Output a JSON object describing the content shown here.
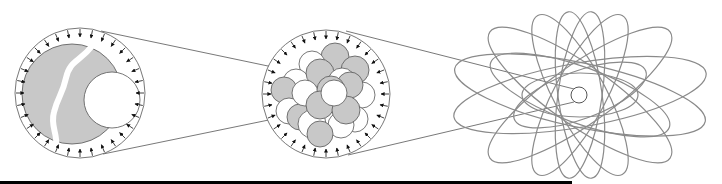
{
  "diagram": {
    "colors": {
      "stroke": "#555555",
      "arrow": "#111111",
      "gray_fill": "#c8c8c8",
      "white_fill": "#ffffff",
      "orbit": "#8a8a8a",
      "bar": "#000000"
    },
    "panels": [
      {
        "id": "panel-left",
        "outer": {
          "cx": 80,
          "cy": 93,
          "r": 65
        },
        "gray_body": {
          "cx": 72,
          "cy": 94,
          "r": 50
        },
        "white_body": {
          "cx": 112,
          "cy": 100,
          "r": 28
        },
        "arrow_count": 32
      },
      {
        "id": "panel-middle",
        "outer": {
          "cx": 326,
          "cy": 94,
          "r": 64
        },
        "arrow_count": 32,
        "particles": [
          {
            "cx": 335,
            "cy": 57,
            "r": 14,
            "fill": "gray"
          },
          {
            "cx": 312,
            "cy": 64,
            "r": 13,
            "fill": "white"
          },
          {
            "cx": 355,
            "cy": 70,
            "r": 14,
            "fill": "gray"
          },
          {
            "cx": 296,
            "cy": 82,
            "r": 13,
            "fill": "white"
          },
          {
            "cx": 284,
            "cy": 90,
            "r": 13,
            "fill": "gray"
          },
          {
            "cx": 362,
            "cy": 95,
            "r": 13,
            "fill": "white"
          },
          {
            "cx": 320,
            "cy": 73,
            "r": 14,
            "fill": "gray"
          },
          {
            "cx": 342,
            "cy": 82,
            "r": 14,
            "fill": "white"
          },
          {
            "cx": 350,
            "cy": 85,
            "r": 13,
            "fill": "gray"
          },
          {
            "cx": 289,
            "cy": 111,
            "r": 13,
            "fill": "white"
          },
          {
            "cx": 300,
            "cy": 117,
            "r": 13,
            "fill": "gray"
          },
          {
            "cx": 305,
            "cy": 93,
            "r": 13,
            "fill": "white"
          },
          {
            "cx": 331,
            "cy": 90,
            "r": 14,
            "fill": "gray"
          },
          {
            "cx": 355,
            "cy": 119,
            "r": 13,
            "fill": "white"
          },
          {
            "cx": 312,
            "cy": 124,
            "r": 14,
            "fill": "white"
          },
          {
            "cx": 320,
            "cy": 105,
            "r": 14,
            "fill": "gray"
          },
          {
            "cx": 341,
            "cy": 125,
            "r": 13,
            "fill": "white"
          },
          {
            "cx": 320,
            "cy": 134,
            "r": 13,
            "fill": "gray"
          },
          {
            "cx": 346,
            "cy": 110,
            "r": 14,
            "fill": "gray"
          },
          {
            "cx": 334,
            "cy": 93,
            "r": 13,
            "fill": "white"
          }
        ]
      },
      {
        "id": "panel-right",
        "nucleus": {
          "cx": 579,
          "cy": 95,
          "r": 8
        },
        "orbits": [
          {
            "cx": 580,
            "cy": 95,
            "rx": 128,
            "ry": 32,
            "rot": -10
          },
          {
            "cx": 580,
            "cy": 95,
            "rx": 128,
            "ry": 32,
            "rot": 12
          },
          {
            "cx": 580,
            "cy": 95,
            "rx": 110,
            "ry": 30,
            "rot": 35
          },
          {
            "cx": 580,
            "cy": 95,
            "rx": 110,
            "ry": 30,
            "rot": -35
          },
          {
            "cx": 580,
            "cy": 95,
            "rx": 90,
            "ry": 26,
            "rot": 62
          },
          {
            "cx": 580,
            "cy": 95,
            "rx": 90,
            "ry": 26,
            "rot": -62
          },
          {
            "cx": 580,
            "cy": 95,
            "rx": 84,
            "ry": 22,
            "rot": 82
          },
          {
            "cx": 580,
            "cy": 95,
            "rx": 84,
            "ry": 22,
            "rot": -82
          },
          {
            "cx": 580,
            "cy": 95,
            "rx": 95,
            "ry": 28,
            "rot": 20
          },
          {
            "cx": 580,
            "cy": 95,
            "rx": 70,
            "ry": 24,
            "rot": -20
          },
          {
            "cx": 580,
            "cy": 95,
            "rx": 58,
            "ry": 22,
            "rot": 0
          }
        ]
      }
    ],
    "connectors": [
      {
        "x1": 101,
        "y1": 31,
        "x2": 330,
        "y2": 79
      },
      {
        "x1": 103,
        "y1": 154,
        "x2": 332,
        "y2": 107
      },
      {
        "x1": 346,
        "y1": 31,
        "x2": 574,
        "y2": 89
      },
      {
        "x1": 348,
        "y1": 155,
        "x2": 574,
        "y2": 102
      }
    ],
    "bottom_bar": {
      "x": 0,
      "width": 572
    }
  }
}
